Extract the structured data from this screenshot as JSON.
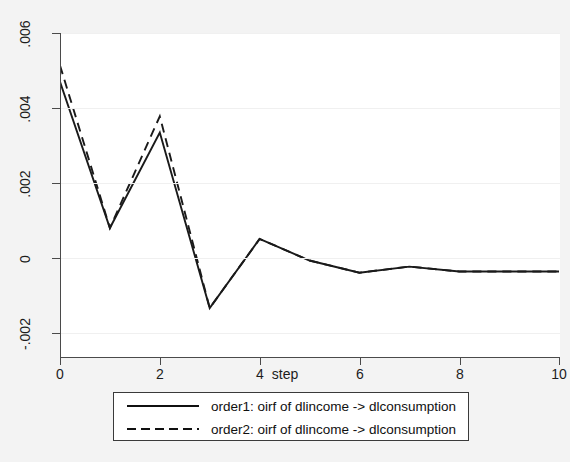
{
  "chart_data": {
    "type": "line",
    "title": "",
    "subtitle": "",
    "xlabel": "step",
    "ylabel": "",
    "xlim": [
      0,
      10
    ],
    "ylim": [
      -0.002,
      0.006
    ],
    "x": [
      0,
      1,
      2,
      3,
      4,
      5,
      6,
      7,
      8,
      9,
      10
    ],
    "xticks": [
      0,
      2,
      4,
      6,
      8,
      10
    ],
    "xticklabels": [
      "0",
      "2",
      "4",
      "6",
      "8",
      "10"
    ],
    "yticks": [
      -0.002,
      0,
      0.002,
      0.004,
      0.006
    ],
    "yticklabels": [
      "-.002",
      "0",
      ".002",
      ".004",
      ".006"
    ],
    "grid": "horizontal",
    "legend_position": "below",
    "series": [
      {
        "name": "order1: oirf of dlincome -> dlconsumption",
        "style": "solid",
        "color": "#1a1a1a",
        "values": [
          0.0048,
          0.0012,
          0.00355,
          -0.00077,
          0.00093,
          0.0004,
          0.0001,
          0.00025,
          0.00013,
          0.00013,
          0.00013
        ]
      },
      {
        "name": "order2: oirf of dlincome -> dlconsumption",
        "style": "dashed",
        "color": "#1a1a1a",
        "values": [
          0.0052,
          0.0012,
          0.00395,
          -0.00077,
          0.00093,
          0.0004,
          0.0001,
          0.00025,
          0.00013,
          0.00013,
          0.00013
        ]
      }
    ]
  },
  "legend": {
    "entries": [
      {
        "label": "order1: oirf of dlincome -> dlconsumption",
        "key": "solid-line-key"
      },
      {
        "label": "order2: oirf of dlincome -> dlconsumption",
        "key": "dashed-line-key"
      }
    ]
  },
  "axis": {
    "x_title": "step"
  }
}
